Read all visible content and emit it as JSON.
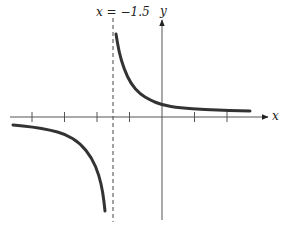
{
  "chart_data": {
    "type": "line",
    "title": "",
    "xlabel": "x",
    "ylabel": "y",
    "annotations": [
      {
        "text": "x = −1.5",
        "kind": "vertical-asymptote",
        "x": -1.5,
        "style": "dashed"
      }
    ],
    "x_ticks": [
      -4,
      -3,
      -2,
      -1,
      1,
      2
    ],
    "x_tick_labels": [],
    "y_ticks": [],
    "grid": false,
    "legend": null,
    "xlim": [
      -4.6,
      3.3
    ],
    "ylim": [
      -3.0,
      2.5
    ],
    "series": [
      {
        "name": "left-branch",
        "description": "x < -1.5, curve below x-axis approaching -infinity near asymptote",
        "points_px": [
          [
            13,
            125
          ],
          [
            33,
            127
          ],
          [
            50,
            130
          ],
          [
            65,
            134
          ],
          [
            80,
            143
          ],
          [
            92,
            158
          ],
          [
            99,
            175
          ],
          [
            103,
            193
          ],
          [
            105,
            211
          ]
        ]
      },
      {
        "name": "right-branch",
        "description": "x > -1.5, curve above x-axis approaching +infinity near asymptote, levelling toward y slightly above 0",
        "points_px": [
          [
            116,
            34
          ],
          [
            119,
            52
          ],
          [
            124,
            69
          ],
          [
            131,
            84
          ],
          [
            140,
            94
          ],
          [
            150,
            100
          ],
          [
            162,
            105
          ],
          [
            180,
            108
          ],
          [
            205,
            109.5
          ],
          [
            230,
            110.5
          ],
          [
            250,
            111
          ]
        ]
      }
    ]
  },
  "labels": {
    "asymptote": "x = −1.5",
    "x_axis": "x",
    "y_axis": "y"
  },
  "layout_px": {
    "origin": [
      162,
      117
    ],
    "unit": 32.5,
    "x_axis_range": [
      10,
      268
    ],
    "y_axis_range": [
      20,
      220
    ],
    "asymptote_x": 113,
    "asymptote_range": [
      18,
      222
    ]
  }
}
